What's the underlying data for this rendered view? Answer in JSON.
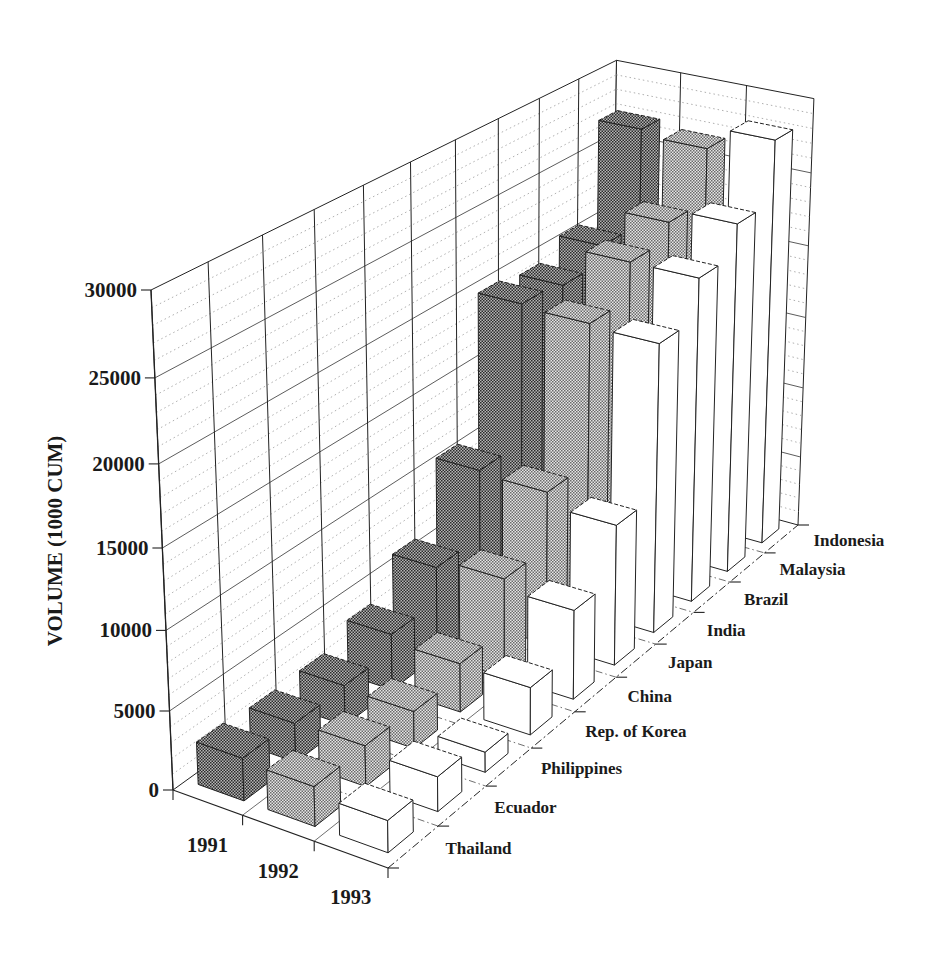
{
  "chart_data": {
    "type": "bar",
    "subtype": "3d-perspective-grouped",
    "title": "",
    "xlabel": "",
    "ylabel": "VOLUME (1000 CUM)",
    "ylim": [
      0,
      30000
    ],
    "yticks": [
      0,
      5000,
      10000,
      15000,
      20000,
      25000,
      30000
    ],
    "ytick_labels": [
      "0",
      "5000",
      "10000",
      "15000",
      "20000",
      "25000",
      "30000"
    ],
    "minor_grid_step": 1000,
    "grid": true,
    "legend": {
      "position": "none"
    },
    "categories": [
      "Thailand",
      "Ecuador",
      "Philippines",
      "Rep. of Korea",
      "China",
      "Japan",
      "India",
      "Brazil",
      "Malaysia",
      "Indonesia"
    ],
    "series": [
      {
        "name": "1991",
        "color": "#6f6f6f",
        "pattern_dot": "#2a2a2a",
        "pattern_base": "#b5b5b5",
        "values": [
          2700,
          2500,
          2600,
          3700,
          6000,
          10500,
          19800,
          19400,
          20500,
          27000
        ]
      },
      {
        "name": "1992",
        "color": "#a8a8a8",
        "pattern_dot": "#6a6a6a",
        "pattern_base": "#e6e6e6",
        "values": [
          2500,
          2600,
          2400,
          3200,
          6600,
          10300,
          19600,
          22000,
          23100,
          26600
        ]
      },
      {
        "name": "1993",
        "color": "#ffffff",
        "pattern_dot": "#ffffff",
        "pattern_base": "#ffffff",
        "values": [
          2000,
          2200,
          1300,
          3100,
          5900,
          9400,
          19400,
          22000,
          24000,
          28100
        ]
      }
    ]
  },
  "colors": {
    "background": "#ffffff",
    "line": "#222222",
    "grid_major": "#4a4a4a",
    "grid_minor": "#9a9a9a",
    "text": "#1a1a1a"
  }
}
